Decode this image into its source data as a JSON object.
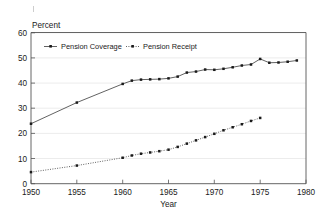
{
  "chart_data": {
    "type": "line",
    "title": "",
    "ylabel": "Percent",
    "xlabel": "Year",
    "xlim": [
      1950,
      1980
    ],
    "ylim": [
      0,
      60
    ],
    "xticks": [
      1950,
      1955,
      1960,
      1965,
      1970,
      1975,
      1980
    ],
    "xticklabels": [
      "1950",
      "1955",
      "1960",
      "1965",
      "1970",
      "1975",
      "1980"
    ],
    "yticks": [
      0,
      10,
      20,
      30,
      40,
      50,
      60
    ],
    "yticklabels": [
      "0",
      "10",
      "20",
      "30",
      "40",
      "50",
      "60"
    ],
    "grid": "horizontal-faint",
    "legend_position": "upper-left-inside",
    "series": [
      {
        "name": "Pension Coverage",
        "style": "solid",
        "marker": "square",
        "x": [
          1950,
          1955,
          1960,
          1961,
          1962,
          1963,
          1964,
          1965,
          1966,
          1967,
          1968,
          1969,
          1970,
          1971,
          1972,
          1973,
          1974,
          1975,
          1976,
          1977,
          1978,
          1979
        ],
        "values": [
          23.8,
          32.2,
          39.6,
          40.9,
          41.3,
          41.4,
          41.5,
          41.8,
          42.5,
          44.1,
          44.5,
          45.3,
          45.2,
          45.6,
          46.2,
          46.9,
          47.3,
          49.5,
          48.0,
          48.1,
          48.4,
          48.9
        ]
      },
      {
        "name": "Pension Receipt",
        "style": "dotted",
        "marker": "square",
        "x": [
          1950,
          1955,
          1960,
          1961,
          1962,
          1963,
          1964,
          1965,
          1966,
          1967,
          1968,
          1969,
          1970,
          1971,
          1972,
          1973,
          1974,
          1975
        ],
        "values": [
          4.6,
          7.2,
          10.3,
          11.2,
          11.9,
          12.4,
          12.9,
          13.5,
          14.6,
          15.9,
          17.2,
          18.5,
          19.8,
          21.2,
          22.4,
          23.6,
          24.9,
          26.1
        ]
      }
    ]
  },
  "legend": {
    "entries": [
      {
        "label": "Pension Coverage",
        "style": "solid"
      },
      {
        "label": "Pension Receipt",
        "style": "dotted"
      }
    ]
  },
  "labels": {
    "y_axis_title": "Percent",
    "x_axis_title": "Year"
  },
  "colors": {
    "line": "#3a3a3a",
    "marker": "#1a1a1a",
    "axis": "#555555",
    "grid": "#d8d8d8",
    "background": "#ffffff"
  }
}
